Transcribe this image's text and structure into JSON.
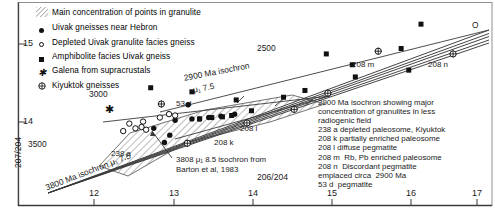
{
  "figure": {
    "type": "lead-isotope-isochron-diagram",
    "x_axis": {
      "label": "206/204",
      "ticks": [
        12,
        13,
        14,
        15,
        16,
        17
      ],
      "min": 11.25,
      "max": 17.45
    },
    "y_axis": {
      "label": "207/204",
      "ticks": [
        14,
        15
      ],
      "min": 12.62,
      "max": 15.62
    }
  },
  "legend": {
    "hatch_entry": {
      "swatch": "diagonal-hatch",
      "label": "Main concentration of points in granulite"
    },
    "items": [
      {
        "marker": "filled-circle",
        "label": "Uivak  gneisses near Hebron"
      },
      {
        "marker": "open-circle",
        "label": "Depleted Uivak granulite facies gneiss"
      },
      {
        "marker": "filled-square",
        "label": "Amphibolite facies Uivak gneiss"
      },
      {
        "marker": "asterisk",
        "label": "Galena from supracrustals"
      },
      {
        "marker": "crossed-circle",
        "label": "Kiyuktok gneisses"
      }
    ]
  },
  "isochron_labels": [
    {
      "name": "ref-2500",
      "text": "2500"
    },
    {
      "name": "ref-3000",
      "text": "3000"
    },
    {
      "name": "ref-3500",
      "text": "3500"
    },
    {
      "name": "isochron-2900",
      "line1": "2900 Ma isochron",
      "line2": "μ₁ 7.5"
    },
    {
      "name": "isochron-3800",
      "text": "3800 Ma isochron μ₁ 7.5"
    },
    {
      "name": "origin-marker",
      "text": "O"
    }
  ],
  "barton_note": {
    "line1": "3808 μ₁ 8.5 isochron from",
    "line2": "Barton et al, 1983"
  },
  "point_labels": [
    {
      "name": "label-238a",
      "text": "238 a"
    },
    {
      "name": "label-53d",
      "text": "53 d"
    },
    {
      "name": "label-208k",
      "text": "208 k"
    },
    {
      "name": "label-208l",
      "text": "208 l"
    },
    {
      "name": "label-208m",
      "text": "208 m"
    },
    {
      "name": "label-208n",
      "text": "208 n"
    }
  ],
  "key_block": [
    "2900 Ma isochron showing major",
    "concentration of granulites in less",
    "radiogenic field",
    "238 a depleted paleosome, Kiyuktok",
    "208 k partially enriched paleosome",
    "208 l diffuse pegmatite",
    "208 m  Rb, Pb enriched paleosome",
    "208 n  Discordant pegmatite",
    "emplaced circa  2900 Ma",
    "53 d  pegmatite"
  ],
  "chart_data": {
    "type": "scatter",
    "title": "",
    "xlabel": "206/204",
    "ylabel": "207/204",
    "xlim": [
      11.25,
      17.45
    ],
    "ylim": [
      12.62,
      15.62
    ],
    "grid": false,
    "legend_position": "top-left",
    "series": [
      {
        "name": "Uivak gneisses near Hebron",
        "marker": "filled-circle",
        "points": [
          [
            13.02,
            13.76
          ],
          [
            13.23,
            13.66
          ],
          [
            13.3,
            13.88
          ],
          [
            13.52,
            13.9
          ],
          [
            13.62,
            13.9
          ],
          [
            13.74,
            13.92
          ],
          [
            13.9,
            13.94
          ],
          [
            14.08,
            13.97
          ],
          [
            13.16,
            13.55
          ],
          [
            13.47,
            14.11
          ]
        ]
      },
      {
        "name": "Depleted Uivak granulite facies gneiss",
        "marker": "open-circle",
        "points": [
          [
            12.7,
            13.83
          ],
          [
            12.78,
            13.76
          ],
          [
            12.86,
            13.78
          ],
          [
            12.92,
            13.74
          ],
          [
            12.88,
            13.86
          ],
          [
            13.1,
            13.92
          ],
          [
            13.22,
            13.97
          ],
          [
            13.3,
            13.95
          ],
          [
            12.62,
            13.72
          ]
        ]
      },
      {
        "name": "Amphibolite facies Uivak gneiss",
        "marker": "filled-square",
        "points": [
          [
            13.62,
            13.9
          ],
          [
            13.78,
            13.92
          ],
          [
            13.92,
            13.93
          ],
          [
            14.04,
            13.95
          ],
          [
            14.3,
            14.02
          ],
          [
            14.72,
            14.22
          ],
          [
            15.0,
            14.32
          ],
          [
            15.28,
            14.86
          ],
          [
            15.62,
            14.7
          ],
          [
            15.66,
            14.52
          ],
          [
            16.26,
            14.94
          ],
          [
            16.36,
            14.62
          ],
          [
            16.52,
            15.3
          ],
          [
            12.98,
            14.36
          ],
          [
            13.52,
            14.3
          ],
          [
            14.1,
            14.18
          ]
        ]
      },
      {
        "name": "Galena from supracrustals",
        "marker": "asterisk",
        "points": [
          [
            12.44,
            14.03
          ]
        ]
      },
      {
        "name": "Kiyuktok gneisses",
        "marker": "crossed-circle",
        "points": [
          [
            13.12,
            14.12
          ],
          [
            13.46,
            13.54
          ],
          [
            14.24,
            13.84
          ],
          [
            14.86,
            14.04
          ],
          [
            15.3,
            14.28
          ],
          [
            15.96,
            14.9
          ],
          [
            16.94,
            14.86
          ]
        ]
      }
    ]
  }
}
